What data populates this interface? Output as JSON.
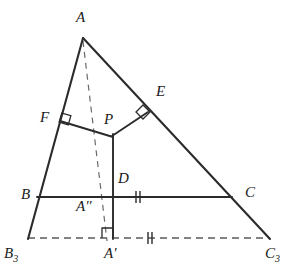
{
  "figure": {
    "width": 301,
    "height": 279,
    "colors": {
      "stroke": "#2b2b2b",
      "dashed": "#5a5a5a",
      "label": "#1a1a1a",
      "background": "#ffffff"
    },
    "points": [
      {
        "id": "A",
        "label": "A",
        "x": 83,
        "y": 38,
        "label_x": 76,
        "label_y": 10
      },
      {
        "id": "B",
        "label": "B",
        "x": 39,
        "y": 197,
        "label_x": 21,
        "label_y": 188
      },
      {
        "id": "C",
        "label": "C",
        "x": 230,
        "y": 197,
        "label_x": 246,
        "label_y": 185
      },
      {
        "id": "E",
        "label": "E",
        "x": 148,
        "y": 112,
        "label_x": 157,
        "label_y": 85
      },
      {
        "id": "F",
        "label": "F",
        "x": 60,
        "y": 121,
        "label_x": 40,
        "label_y": 110
      },
      {
        "id": "P",
        "label": "P",
        "x": 113,
        "y": 136,
        "label_x": 105,
        "label_y": 113
      },
      {
        "id": "D",
        "label": "D",
        "x": 113,
        "y": 197,
        "label_x": 119,
        "label_y": 172
      },
      {
        "id": "A2",
        "label": "A''",
        "x": 107,
        "y": 197,
        "label_x": 78,
        "label_y": 200
      },
      {
        "id": "A1",
        "label": "A'",
        "x": 113,
        "y": 238,
        "label_x": 105,
        "label_y": 247
      },
      {
        "id": "B3",
        "label": "B3",
        "x": 28,
        "y": 238,
        "label_x": 4,
        "label_y": 247
      },
      {
        "id": "C3",
        "label": "C3",
        "x": 270,
        "y": 238,
        "label_x": 265,
        "label_y": 247
      }
    ],
    "solid_segments": [
      {
        "name": "side-AB-extended-to-B3",
        "x1": 83,
        "y1": 38,
        "x2": 28,
        "y2": 238
      },
      {
        "name": "side-AC-extended-to-C3",
        "x1": 83,
        "y1": 38,
        "x2": 270,
        "y2": 238
      },
      {
        "name": "side-BC",
        "x1": 39,
        "y1": 197,
        "x2": 230,
        "y2": 197
      },
      {
        "name": "segment-FP",
        "x1": 60,
        "y1": 121,
        "x2": 113,
        "y2": 137
      },
      {
        "name": "segment-PE",
        "x1": 113,
        "y1": 136,
        "x2": 148,
        "y2": 112
      },
      {
        "name": "segment-P-to-Aprime",
        "x1": 113,
        "y1": 135,
        "x2": 113,
        "y2": 238
      }
    ],
    "dashed_segments": [
      {
        "name": "cevian-A-to-Adoubleprime",
        "x1": 83,
        "y1": 40,
        "x2": 107,
        "y2": 240
      },
      {
        "name": "baseline-B3-to-C3",
        "x1": 28,
        "y1": 238,
        "x2": 270,
        "y2": 238
      }
    ],
    "right_angle_marks": [
      {
        "name": "right-angle-at-F",
        "x": 60,
        "y": 121,
        "rot": 17,
        "size": 9
      },
      {
        "name": "right-angle-at-E",
        "x": 148,
        "y": 112,
        "rot": -34,
        "size": 9
      },
      {
        "name": "right-angle-at-Aprime",
        "x": 113,
        "y": 238,
        "rot": 0,
        "size": 10
      }
    ],
    "tick_marks": [
      {
        "name": "tick-DC-midpoint",
        "x": 138,
        "y": 197,
        "count": 2,
        "orient": "vertical"
      },
      {
        "name": "tick-Aprime-C3-midpoint",
        "x": 150,
        "y": 238,
        "count": 2,
        "orient": "vertical"
      }
    ]
  }
}
